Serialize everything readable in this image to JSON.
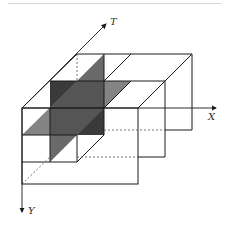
{
  "diagram": {
    "type": "3d-stepped-block-diagram",
    "axes": {
      "x_label": "X",
      "y_label": "Y",
      "t_label": "T"
    },
    "colors": {
      "line": "#1a1a1a",
      "dark_plane": "#3a3a3a",
      "mid_plane": "#5e5e5e",
      "light_plane": "#7a7a7a",
      "background": "#ffffff"
    }
  }
}
